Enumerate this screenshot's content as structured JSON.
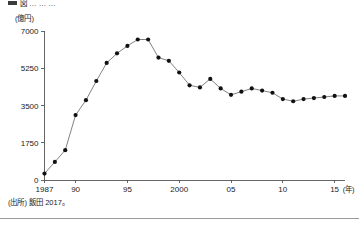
{
  "figure": {
    "caption": "図 … … …",
    "unit_label": "(億円)",
    "source_note": "(出所) 飯田 2017。"
  },
  "chart_data": {
    "type": "line",
    "title": "",
    "subtitle": "",
    "xlabel": "(年)",
    "ylabel": "(億円)",
    "grid": false,
    "legend": false,
    "marker": "filled-circle",
    "xlim": [
      1987,
      2016
    ],
    "ylim": [
      0,
      7000
    ],
    "yticks": [
      0,
      1750,
      3500,
      5250,
      7000
    ],
    "ytick_labels": [
      "0",
      "1750",
      "3500",
      "5250",
      "7000"
    ],
    "xticks": [
      1987,
      1990,
      1995,
      2000,
      2005,
      2010,
      2015
    ],
    "xtick_labels": [
      "1987",
      "90",
      "95",
      "2000",
      "05",
      "10",
      "15"
    ],
    "x": [
      1987,
      1988,
      1989,
      1990,
      1991,
      1992,
      1993,
      1994,
      1995,
      1996,
      1997,
      1998,
      1999,
      2000,
      2001,
      2002,
      2003,
      2004,
      2005,
      2006,
      2007,
      2008,
      2009,
      2010,
      2011,
      2012,
      2013,
      2014,
      2015,
      2016
    ],
    "values": [
      300,
      850,
      1400,
      3050,
      3750,
      4650,
      5500,
      5950,
      6300,
      6600,
      6600,
      5750,
      5600,
      5050,
      4450,
      4350,
      4750,
      4300,
      4000,
      4150,
      4300,
      4200,
      4100,
      3800,
      3700,
      3800,
      3850,
      3900,
      3950,
      3950
    ],
    "series": [
      {
        "name": "市場規模",
        "values": [
          300,
          850,
          1400,
          3050,
          3750,
          4650,
          5500,
          5950,
          6300,
          6600,
          6600,
          5750,
          5600,
          5050,
          4450,
          4350,
          4750,
          4300,
          4000,
          4150,
          4300,
          4200,
          4100,
          3800,
          3700,
          3800,
          3850,
          3900,
          3950,
          3950
        ]
      }
    ]
  },
  "colors": {
    "line": "#6b6b6b",
    "marker": "#111111",
    "axis": "#555555",
    "text": "#1a1a1a",
    "background": "#ffffff"
  }
}
